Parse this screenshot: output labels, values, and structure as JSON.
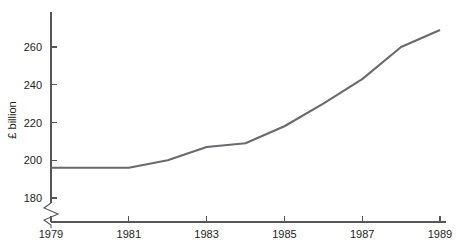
{
  "chart_data": {
    "type": "line",
    "title": "",
    "subtitle": "",
    "xlabel": "",
    "ylabel": "£ billion",
    "x": [
      1979,
      1980,
      1981,
      1982,
      1983,
      1984,
      1985,
      1986,
      1987,
      1988,
      1989
    ],
    "values": [
      196,
      196,
      196,
      200,
      207,
      209,
      218,
      230,
      243,
      260,
      269
    ],
    "series": [
      {
        "name": "",
        "values": [
          196,
          196,
          196,
          200,
          207,
          209,
          218,
          230,
          243,
          260,
          269
        ]
      }
    ],
    "xlim": [
      1979,
      1989
    ],
    "ylim": [
      176,
      274
    ],
    "xticks": [
      1979,
      1981,
      1983,
      1985,
      1987,
      1989
    ],
    "xtick_labels": [
      "1979",
      "1981",
      "1983",
      "1985",
      "1987",
      "1989"
    ],
    "yticks": [
      180,
      200,
      220,
      240,
      260
    ],
    "ytick_labels": [
      "180",
      "200",
      "220",
      "240",
      "260"
    ],
    "grid": false,
    "legend": null,
    "axis_break": {
      "axis": "y",
      "below_value": 180,
      "symbol": "zigzag"
    },
    "line_color": "#6a6a6e",
    "axis_color": "#55555a",
    "text_color": "#1c1c1c",
    "background_color": "#ffffff"
  }
}
